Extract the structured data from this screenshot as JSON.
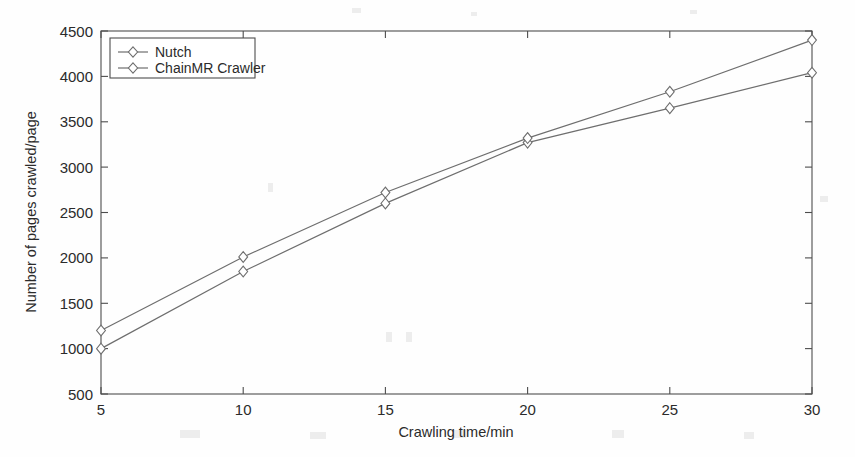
{
  "chart_data": {
    "type": "line",
    "title": "",
    "xlabel": "Crawling time/min",
    "ylabel": "Number of pages crawled/page",
    "x": [
      5,
      10,
      15,
      20,
      25,
      30
    ],
    "xticklabels": [
      "5",
      "10",
      "15",
      "20",
      "25",
      "30"
    ],
    "yticklabels": [
      "500",
      "1000",
      "1500",
      "2000",
      "2500",
      "3000",
      "3500",
      "4000",
      "4500"
    ],
    "yticks": [
      500,
      1000,
      1500,
      2000,
      2500,
      3000,
      3500,
      4000,
      4500
    ],
    "xlim": [
      5,
      30
    ],
    "ylim": [
      500,
      4500
    ],
    "grid": false,
    "legend_position": "upper left",
    "marker": "diamond",
    "series": [
      {
        "name": "Nutch",
        "values": [
          1000,
          1850,
          2600,
          3270,
          3650,
          4040
        ]
      },
      {
        "name": "ChainMR Crawler",
        "values": [
          1200,
          2010,
          2720,
          3320,
          3830,
          4400
        ]
      }
    ]
  },
  "legend": {
    "entries": [
      {
        "label": "Nutch"
      },
      {
        "label": "ChainMR Crawler"
      }
    ]
  },
  "colors": {
    "axis": "#4d4d4d",
    "series": "#6e6e6e",
    "background": "#fefefe",
    "text": "#2b2b2b"
  }
}
